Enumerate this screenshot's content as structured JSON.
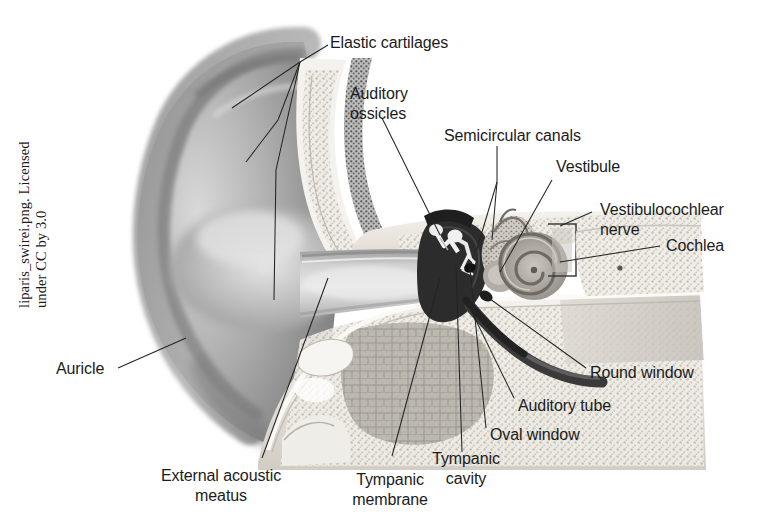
{
  "figure": {
    "credit_line": "liparis_swirei.png. Licensed\nunder CC by 3.0",
    "background_color": "#ffffff",
    "text_color": "#1b1b1b",
    "leader_line_color": "#242424"
  },
  "labels": [
    {
      "id": "elastic-cartilages",
      "text": "Elastic cartilages"
    },
    {
      "id": "auditory-ossicles",
      "text": "Auditory\nossicles"
    },
    {
      "id": "semicircular-canals",
      "text": "Semicircular canals"
    },
    {
      "id": "vestibule",
      "text": "Vestibule"
    },
    {
      "id": "vestibulocochlear-nerve",
      "text": "Vestibulocochlear\nnerve"
    },
    {
      "id": "cochlea",
      "text": "Cochlea"
    },
    {
      "id": "round-window",
      "text": "Round window"
    },
    {
      "id": "auditory-tube",
      "text": "Auditory tube"
    },
    {
      "id": "oval-window",
      "text": "Oval window"
    },
    {
      "id": "tympanic-cavity",
      "text": "Tympanic\ncavity"
    },
    {
      "id": "tympanic-membrane",
      "text": "Tympanic\nmembrane"
    },
    {
      "id": "external-acoustic-meatus",
      "text": "External acoustic\nmeatus"
    },
    {
      "id": "auricle",
      "text": "Auricle"
    }
  ],
  "palette": {
    "auricle_dark": "#8c8c8c",
    "auricle_mid": "#a9a9a9",
    "auricle_light": "#cfcfcf",
    "bone_light": "#efece6",
    "bone_mid": "#d8d4cc",
    "cartilage_stipple": "#6d6d6d",
    "cavity_dark": "#2a2a2a",
    "canal_shadow": "#b8b4ae",
    "mastoid_cells": "#b6b2ab",
    "cochlea_gray": "#9a968f"
  }
}
